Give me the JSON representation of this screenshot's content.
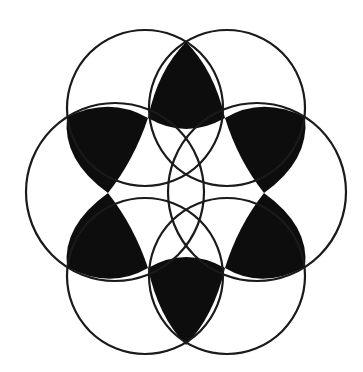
{
  "figure": {
    "colors": {
      "background": "#ffffff",
      "stroke": "#1a1a1a",
      "fill": "#0d0d0d"
    },
    "circles": [
      {
        "name": "upper-left",
        "cx": 145,
        "cy": 108,
        "r": 78
      },
      {
        "name": "upper-right",
        "cx": 227,
        "cy": 108,
        "r": 78
      },
      {
        "name": "right",
        "cx": 257,
        "cy": 192,
        "r": 89
      },
      {
        "name": "lower-right",
        "cx": 227,
        "cy": 276,
        "r": 78
      },
      {
        "name": "lower-left",
        "cx": 145,
        "cy": 276,
        "r": 78
      },
      {
        "name": "left",
        "cx": 115,
        "cy": 192,
        "r": 89
      }
    ],
    "lenses": [
      {
        "name": "top",
        "d": "M186,42 Q214,70 225,118 Q186,140 148,118 Q158,70 186,42 Z"
      },
      {
        "name": "upper-right",
        "d": "M225,118 Q262,96 305,117 Q310,160 264,193 Q238,160 225,118 Z"
      },
      {
        "name": "lower-right",
        "d": "M264,193 Q310,226 305,267 Q262,290 225,268 Q238,226 264,193 Z"
      },
      {
        "name": "bottom",
        "d": "M225,268 Q214,316 186,345 Q158,316 148,268 Q186,246 225,268 Z"
      },
      {
        "name": "lower-left",
        "d": "M148,268 Q110,290 67,267 Q62,226 108,193 Q134,226 148,268 Z"
      },
      {
        "name": "upper-left",
        "d": "M108,193 Q62,160 67,117 Q110,96 148,118 Q134,160 108,193 Z"
      }
    ]
  }
}
